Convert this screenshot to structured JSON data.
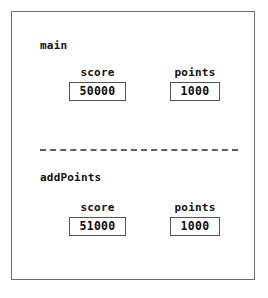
{
  "diagram": {
    "frame_border_color": "#6e6e6e",
    "box_border_color": "#555555",
    "divider_color": "#5d5d5d",
    "background_color": "#ffffff",
    "text_color": "#111111",
    "scopes": [
      {
        "id": "main",
        "title": "main",
        "variables": [
          {
            "name": "score",
            "label": "score",
            "value": "50000"
          },
          {
            "name": "points",
            "label": "points",
            "value": "1000"
          }
        ]
      },
      {
        "id": "addPoints",
        "title": "addPoints",
        "variables": [
          {
            "name": "score",
            "label": "score",
            "value": "51000"
          },
          {
            "name": "points",
            "label": "points",
            "value": "1000"
          }
        ]
      }
    ]
  }
}
